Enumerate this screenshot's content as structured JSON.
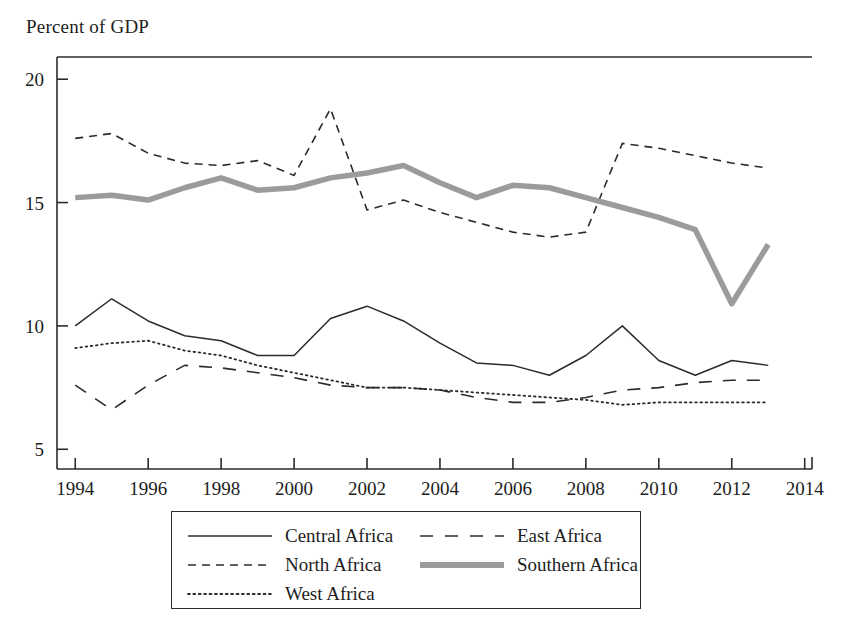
{
  "chart_data": {
    "type": "line",
    "title": "",
    "ylabel": "Percent of GDP",
    "xlabel": "",
    "xlim": [
      1993.5,
      2014.2
    ],
    "ylim": [
      4.2,
      20.9
    ],
    "grid": false,
    "legend_position": "bottom",
    "x_ticks": [
      1994,
      1996,
      1998,
      2000,
      2002,
      2004,
      2006,
      2008,
      2010,
      2012,
      2014
    ],
    "x_tick_labels": [
      "1994",
      "1996",
      "1998",
      "2000",
      "2002",
      "2004",
      "2006",
      "2008",
      "2010",
      "2012",
      "2014"
    ],
    "y_ticks": [
      5,
      10,
      15,
      20
    ],
    "y_tick_labels": [
      "5",
      "10",
      "15",
      "20"
    ],
    "x": [
      1994,
      1995,
      1996,
      1997,
      1998,
      1999,
      2000,
      2001,
      2002,
      2003,
      2004,
      2005,
      2006,
      2007,
      2008,
      2009,
      2010,
      2011,
      2012,
      2013
    ],
    "series": [
      {
        "name": "Central Africa",
        "style": "solid",
        "color": "#2b2b2b",
        "width": 1.5,
        "values": [
          10.0,
          11.1,
          10.2,
          9.6,
          9.4,
          8.8,
          8.8,
          10.3,
          10.8,
          10.2,
          9.3,
          8.5,
          8.4,
          8.0,
          8.8,
          10.0,
          8.6,
          8.0,
          8.6,
          8.4
        ]
      },
      {
        "name": "East Africa",
        "style": "dash-long",
        "color": "#2b2b2b",
        "width": 1.6,
        "values": [
          7.6,
          6.6,
          7.6,
          8.4,
          8.3,
          8.1,
          7.9,
          7.6,
          7.5,
          7.5,
          7.4,
          7.1,
          6.9,
          6.9,
          7.1,
          7.4,
          7.5,
          7.7,
          7.8,
          7.8
        ]
      },
      {
        "name": "North Africa",
        "style": "dash-medium",
        "color": "#2b2b2b",
        "width": 1.6,
        "values": [
          17.6,
          17.8,
          17.0,
          16.6,
          16.5,
          16.7,
          16.1,
          18.8,
          14.7,
          15.1,
          14.6,
          14.2,
          13.8,
          13.6,
          13.8,
          17.4,
          17.2,
          16.9,
          16.6,
          16.4
        ]
      },
      {
        "name": "Southern Africa",
        "style": "thick",
        "color": "#9b9b9b",
        "width": 5.5,
        "values": [
          15.2,
          15.3,
          15.1,
          15.6,
          16.0,
          15.5,
          15.6,
          16.0,
          16.2,
          16.5,
          15.8,
          15.2,
          15.7,
          15.6,
          15.2,
          14.8,
          14.4,
          13.9,
          10.9,
          13.3
        ]
      },
      {
        "name": "West Africa",
        "style": "dotted",
        "color": "#2b2b2b",
        "width": 1.8,
        "values": [
          9.1,
          9.3,
          9.4,
          9.0,
          8.8,
          8.4,
          8.1,
          7.8,
          7.5,
          7.5,
          7.4,
          7.3,
          7.2,
          7.1,
          7.0,
          6.8,
          6.9,
          6.9,
          6.9,
          6.9
        ]
      }
    ]
  },
  "legend": {
    "items": [
      {
        "label": "Central Africa",
        "key": "solid"
      },
      {
        "label": "East Africa",
        "key": "dash-long"
      },
      {
        "label": "North Africa",
        "key": "dash-medium"
      },
      {
        "label": "Southern Africa",
        "key": "thick"
      },
      {
        "label": "West Africa",
        "key": "dotted"
      }
    ]
  }
}
